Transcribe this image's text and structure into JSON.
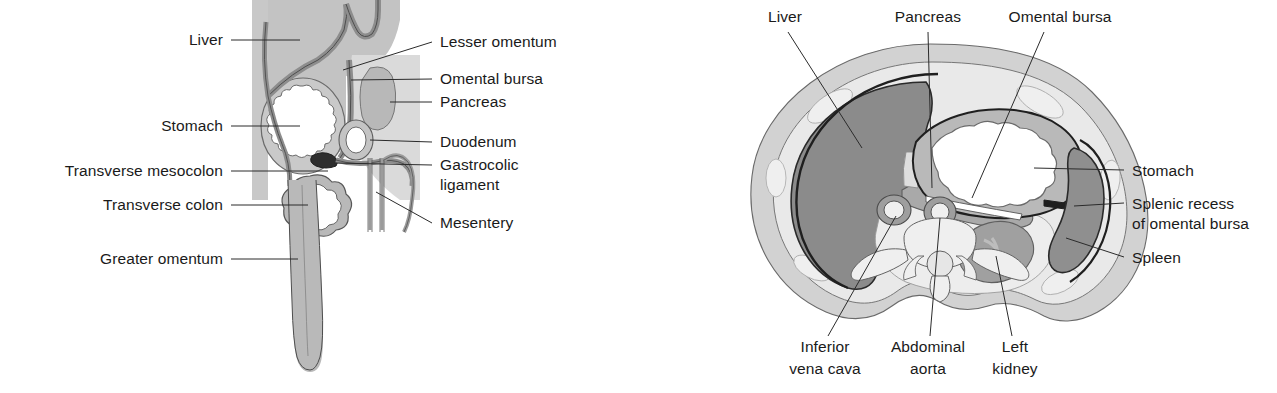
{
  "figure": {
    "panels": [
      {
        "id": "sagittal",
        "name": "Midsagittal section of abdomen"
      },
      {
        "id": "transverse",
        "name": "Transverse section of abdomen"
      }
    ]
  },
  "colors": {
    "ink": "#1a1a1a",
    "leader": "#2b2b2b",
    "outline": "#3a3a3a",
    "paper": "#ffffff",
    "liver_fill": "#8b8b8b",
    "liver_fill_sagittal": "#c3c3c3",
    "body_wall": "#d2d2d2",
    "subcutaneous": "#dcdcdc",
    "retroperitoneum": "#e8e8e8",
    "peritoneum_band": "#9a9a9a",
    "pancreas_fill": "#a9a9a9",
    "spleen_fill": "#8f8f8f",
    "kidney_fill": "#a0a0a0",
    "kidney_hilum": "#b4b4b4",
    "muscle_slip": "#eaeaea",
    "lumen_white": "#ffffff",
    "mesentery_fill": "#b5b5b5",
    "vessel_wall": "#9e9e9e",
    "bone_fill": "#efefef",
    "dark_band": "#1f1f1f"
  },
  "sagittal": {
    "labels_left": [
      {
        "id": "liver",
        "text": "Liver",
        "x": 223,
        "y": 44,
        "anchor": "end",
        "leader": "M231,40 L300,40"
      },
      {
        "id": "stomach",
        "text": "Stomach",
        "x": 223,
        "y": 131,
        "anchor": "end",
        "leader": "M231,126 L305,126"
      },
      {
        "id": "transverse-mesocolon",
        "text": "Transverse mesocolon",
        "x": 223,
        "y": 176,
        "anchor": "end",
        "leader": "M231,171 L330,171"
      },
      {
        "id": "transverse-colon",
        "text": "Transverse colon",
        "x": 223,
        "y": 210,
        "anchor": "end",
        "leader": "M231,205 L310,205"
      },
      {
        "id": "greater-omentum",
        "text": "Greater omentum",
        "x": 223,
        "y": 264,
        "anchor": "end",
        "leader": "M231,259 L290,259"
      }
    ],
    "labels_right": [
      {
        "id": "lesser-omentum",
        "text": "Lesser omentum",
        "x": 440,
        "y": 47,
        "anchor": "start",
        "leader": "M435,42 L345,70"
      },
      {
        "id": "omental-bursa",
        "text": "Omental bursa",
        "x": 440,
        "y": 84,
        "anchor": "start",
        "leader": "M435,79 L352,79"
      },
      {
        "id": "pancreas",
        "text": "Pancreas",
        "x": 440,
        "y": 107,
        "anchor": "start",
        "leader": "M435,102 L378,100"
      },
      {
        "id": "duodenum",
        "text": "Duodenum",
        "x": 440,
        "y": 147,
        "anchor": "start",
        "leader": "M435,142 L370,140"
      },
      {
        "id": "gastrocolic-ligament-1",
        "text": "Gastrocolic",
        "x": 440,
        "y": 170,
        "anchor": "start",
        "leader": "M435,165 L330,170"
      },
      {
        "id": "gastrocolic-ligament-2",
        "text": "ligament",
        "x": 440,
        "y": 190,
        "anchor": "start",
        "leader": ""
      },
      {
        "id": "mesentery",
        "text": "Mesentery",
        "x": 440,
        "y": 228,
        "anchor": "start",
        "leader": "M435,223 L373,194"
      }
    ]
  },
  "transverse": {
    "labels_top": [
      {
        "id": "liver",
        "text": "Liver",
        "x": 145,
        "y": 22,
        "anchor": "middle",
        "leader": "M148,30 L218,146"
      },
      {
        "id": "pancreas",
        "text": "Pancreas",
        "x": 288,
        "y": 22,
        "anchor": "middle",
        "leader": "M288,30 L290,182"
      },
      {
        "id": "omental-bursa",
        "text": "Omental bursa",
        "x": 420,
        "y": 22,
        "anchor": "middle",
        "leader": "M405,30 L330,185"
      }
    ],
    "labels_right": [
      {
        "id": "stomach",
        "text": "Stomach",
        "x": 490,
        "y": 175,
        "anchor": "start",
        "leader": "M485,170 L392,168"
      },
      {
        "id": "splenic-recess-1",
        "text": "Splenic recess",
        "x": 490,
        "y": 208,
        "anchor": "start",
        "leader": "M485,203 L389,200"
      },
      {
        "id": "splenic-recess-2",
        "text": "of omental bursa",
        "x": 490,
        "y": 228,
        "anchor": "start",
        "leader": ""
      },
      {
        "id": "spleen",
        "text": "Spleen",
        "x": 490,
        "y": 262,
        "anchor": "start",
        "leader": "M485,257 L416,235"
      }
    ],
    "labels_bottom": [
      {
        "id": "inferior-vena-cava-1",
        "text": "Inferior",
        "x": 185,
        "y": 350,
        "anchor": "middle",
        "leader": "M188,336 L255,212"
      },
      {
        "id": "inferior-vena-cava-2",
        "text": "vena cava",
        "x": 185,
        "y": 372,
        "anchor": "middle",
        "leader": ""
      },
      {
        "id": "abdominal-aorta-1",
        "text": "Abdominal",
        "x": 288,
        "y": 350,
        "anchor": "middle",
        "leader": "M288,336 L290,213"
      },
      {
        "id": "abdominal-aorta-2",
        "text": "aorta",
        "x": 288,
        "y": 372,
        "anchor": "middle",
        "leader": ""
      },
      {
        "id": "left-kidney-1",
        "text": "Left",
        "x": 375,
        "y": 350,
        "anchor": "middle",
        "leader": "M372,336 L355,250"
      },
      {
        "id": "left-kidney-2",
        "text": "kidney",
        "x": 375,
        "y": 372,
        "anchor": "middle",
        "leader": ""
      }
    ]
  }
}
